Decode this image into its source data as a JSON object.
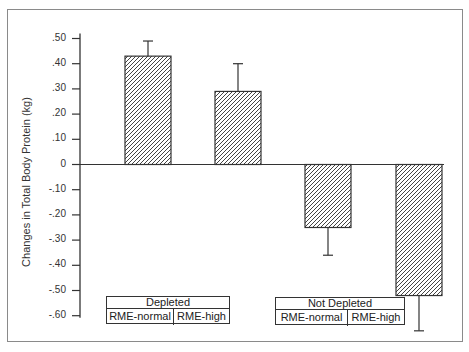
{
  "chart_data": {
    "type": "bar",
    "title": "",
    "xlabel": "",
    "ylabel": "Changes in Total Body Protein (kg)",
    "ylim": [
      -0.6,
      0.5
    ],
    "yticks": [
      0.5,
      0.4,
      0.3,
      0.2,
      0.1,
      0,
      -0.1,
      -0.2,
      -0.3,
      -0.4,
      -0.5,
      -0.6
    ],
    "ytick_labels": [
      ".50",
      ".40",
      ".30",
      ".20",
      ".10",
      "0",
      "-.10",
      "-.20",
      "-.30",
      "-.40",
      "-.50",
      "-.60"
    ],
    "grid": false,
    "pattern": "diagonal-hatch",
    "groups": [
      {
        "label": "Depleted",
        "subcategories": [
          "RME-normal",
          "RME-high"
        ]
      },
      {
        "label": "Not Depleted",
        "subcategories": [
          "RME-normal",
          "RME-high"
        ]
      }
    ],
    "categories": [
      "Depleted / RME-normal",
      "Depleted / RME-high",
      "Not Depleted / RME-normal",
      "Not Depleted / RME-high"
    ],
    "values": [
      0.43,
      0.29,
      -0.25,
      -0.52
    ],
    "error_bars": [
      0.06,
      0.11,
      0.11,
      0.14
    ]
  },
  "labels": {
    "ylabel": "Changes in Total Body Protein (kg)",
    "group1": {
      "title": "Depleted",
      "left": "RME-normal",
      "right": "RME-high"
    },
    "group2": {
      "title": "Not Depleted",
      "left": "RME-normal",
      "right": "RME-high"
    },
    "ticks": [
      ".50",
      ".40",
      ".30",
      ".20",
      ".10",
      "0",
      "-.10",
      "-.20",
      "-.30",
      "-.40",
      "-.50",
      "-.60"
    ]
  }
}
